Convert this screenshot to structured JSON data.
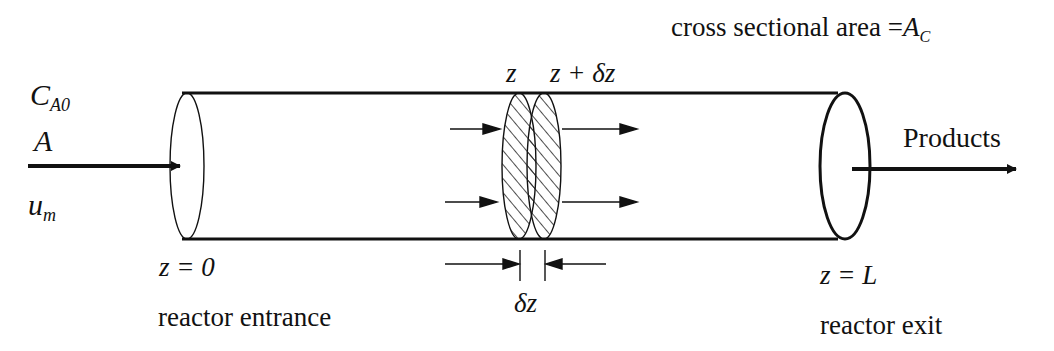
{
  "diagram": {
    "inlet": {
      "concentration_symbol": "C",
      "concentration_subscript": "A0",
      "species": "A",
      "velocity_symbol": "u",
      "velocity_subscript": "m"
    },
    "outlet": {
      "label": "Products"
    },
    "cross_section": {
      "text": "cross sectional area =",
      "symbol": "A",
      "subscript": "C"
    },
    "element": {
      "left_label": "z",
      "right_label": "z + δz",
      "thickness_label": "δz"
    },
    "positions": {
      "start_eq": "z = 0",
      "start_name": "reactor entrance",
      "end_eq": "z = L",
      "end_name": "reactor exit"
    },
    "colors": {
      "stroke": "#111111",
      "background": "#ffffff"
    }
  }
}
